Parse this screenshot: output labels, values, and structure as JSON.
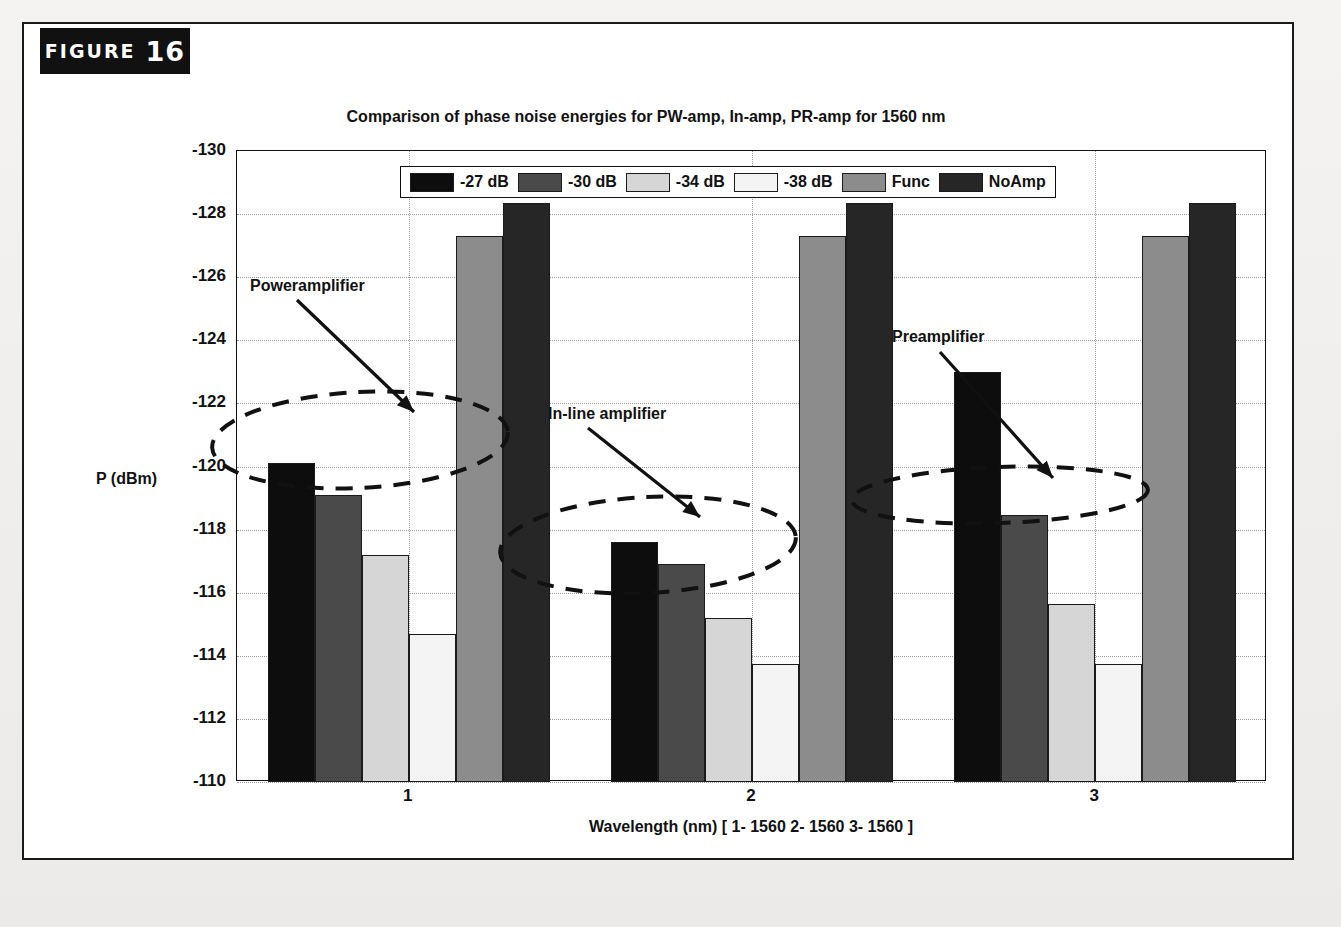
{
  "figure": {
    "banner_word": "FIGURE",
    "banner_number": "16"
  },
  "chart_data": {
    "type": "bar",
    "title": "Comparison of phase noise energies for PW-amp, In-amp, PR-amp for 1560 nm",
    "xlabel": "Wavelength (nm) [ 1-  1560  2-  1560  3- 1560 ]",
    "ylabel": "P (dBm)",
    "categories": [
      "1",
      "2",
      "3"
    ],
    "ylim": [
      -130,
      -110
    ],
    "y_inverted": true,
    "ytick_labels": [
      "-130",
      "-128",
      "-126",
      "-124",
      "-122",
      "-120",
      "-118",
      "-116",
      "-114",
      "-112",
      "-110"
    ],
    "ytick_values": [
      -130,
      -128,
      -126,
      -124,
      -122,
      -120,
      -118,
      -116,
      -114,
      -112,
      -110
    ],
    "grid": true,
    "legend_position": "top-center",
    "series": [
      {
        "name": "-27 dB",
        "color": "#0d0d0d",
        "values": [
          -120.1,
          -117.6,
          -123.0
        ]
      },
      {
        "name": "-30 dB",
        "color": "#4a4a4a",
        "values": [
          -119.1,
          -116.9,
          -118.45
        ]
      },
      {
        "name": "-34 dB",
        "color": "#d6d6d6",
        "values": [
          -117.2,
          -115.2,
          -115.65
        ]
      },
      {
        "name": "-38 dB",
        "color": "#f4f4f4",
        "values": [
          -114.7,
          -113.75,
          -113.75
        ]
      },
      {
        "name": "Func",
        "color": "#8c8c8c",
        "values": [
          -127.3,
          -127.3,
          -127.3
        ]
      },
      {
        "name": "NoAmp",
        "color": "#262626",
        "values": [
          -128.35,
          -128.35,
          -128.35
        ]
      }
    ],
    "annotations": [
      {
        "label": "Poweramplifier",
        "target_group": "1"
      },
      {
        "label": "In-line amplifier",
        "target_group": "2"
      },
      {
        "label": "Preamplifier",
        "target_group": "3"
      }
    ]
  }
}
